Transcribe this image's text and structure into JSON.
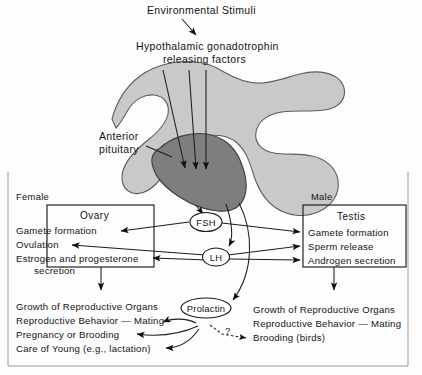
{
  "figure": {
    "title_top": "Environmental Stimuli",
    "hypothalamic_line1": "Hypothalamic gonadotrophin",
    "hypothalamic_line2": "releasing factors",
    "anterior_line1": "Anterior",
    "anterior_line2": "pituitary"
  },
  "hormones": {
    "fsh": "FSH",
    "lh": "LH",
    "prolactin": "Prolactin",
    "question_mark": "?"
  },
  "female": {
    "sex_label": "Female",
    "box_title": "Ovary",
    "box_items": [
      "Gamete formation",
      "Ovulation",
      "Estrogen and progesterone",
      "secretion"
    ],
    "outcomes": [
      "Growth of Reproductive Organs",
      "Reproductive Behavior — Mating",
      "Pregnancy or Brooding",
      "Care of Young (e.g., lactation)"
    ]
  },
  "male": {
    "sex_label": "Male",
    "box_title": "Testis",
    "box_items": [
      "Gamete formation",
      "Sperm release",
      "Androgen secretion"
    ],
    "outcomes": [
      "Growth of Reproductive Organs",
      "Reproductive Behavior — Mating",
      "Brooding (birds)"
    ]
  },
  "colors": {
    "brain": "#c9c9c9",
    "pituitary": "#7e7e7e",
    "ink": "#141414",
    "frame": "#9a9a9a",
    "page": "#fdfdfd"
  }
}
